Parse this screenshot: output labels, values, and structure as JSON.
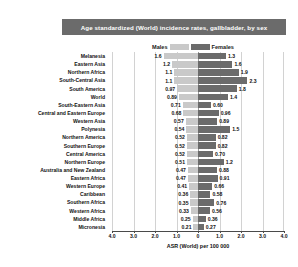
{
  "title": "Age standardized (World) incidence rates, gallbladder, by sex",
  "legend": {
    "males_label": "Males",
    "females_label": "Females",
    "males_color": "#c9c9c9",
    "females_color": "#6b6b6b"
  },
  "colors": {
    "banner": "#6b6b6b",
    "banner_text": "#ffffff",
    "male_bar": "#c9c9c9",
    "female_bar": "#6b6b6b",
    "grid": "#d2d2d2",
    "axis": "#4a4a4a"
  },
  "chart_data": {
    "type": "bar",
    "orientation": "horizontal-diverging",
    "title": "Age standardized (World) incidence rates, gallbladder, by sex",
    "xlabel": "ASR (World) per 100 000",
    "ylabel": "",
    "xlim": [
      -4.0,
      4.0
    ],
    "xticks": [
      "4.0",
      "3.0",
      "2.0",
      "1.0",
      "0",
      "1.0",
      "2.0",
      "3.0",
      "4.0"
    ],
    "xtick_values": [
      -4.0,
      -3.0,
      -2.0,
      -1.0,
      0,
      1.0,
      2.0,
      3.0,
      4.0
    ],
    "grid": true,
    "legend_position": "top-right",
    "categories": [
      "Melanesia",
      "Eastern Asia",
      "Northern Africa",
      "South-Central Asia",
      "South America",
      "World",
      "South-Eastern Asia",
      "Central and Eastern Europe",
      "Western Asia",
      "Polynesia",
      "Northern America",
      "Southern Europe",
      "Central America",
      "Northern Europe",
      "Australia and New Zealand",
      "Eastern Africa",
      "Western Europe",
      "Caribbean",
      "Southern Africa",
      "Western Africa",
      "Middle Africa",
      "Micronesia"
    ],
    "series": [
      {
        "name": "Males",
        "color": "#c9c9c9",
        "values": [
          1.6,
          1.2,
          1.1,
          1.1,
          0.97,
          0.89,
          0.71,
          0.68,
          0.57,
          0.54,
          0.52,
          0.52,
          0.52,
          0.51,
          0.47,
          0.47,
          0.41,
          0.36,
          0.35,
          0.33,
          0.25,
          0.21
        ],
        "labels": [
          "1.6",
          "1.2",
          "1.1",
          "1.1",
          "0.97",
          "0.89",
          "0.71",
          "0.68",
          "0.57",
          "0.54",
          "0.52",
          "0.52",
          "0.52",
          "0.51",
          "0.47",
          "0.47",
          "0.41",
          "0.36",
          "0.35",
          "0.33",
          "0.25",
          "0.21"
        ]
      },
      {
        "name": "Females",
        "color": "#6b6b6b",
        "values": [
          1.3,
          1.6,
          1.9,
          2.3,
          1.8,
          1.4,
          0.6,
          0.96,
          0.89,
          1.5,
          0.82,
          0.82,
          0.7,
          1.2,
          0.88,
          0.91,
          0.66,
          0.58,
          0.76,
          0.56,
          0.36,
          0.27
        ],
        "labels": [
          "1.3",
          "1.6",
          "1.9",
          "2.3",
          "1.8",
          "1.4",
          "0.60",
          "0.96",
          "0.89",
          "1.5",
          "0.82",
          "0.82",
          "0.70",
          "1.2",
          "0.88",
          "0.91",
          "0.66",
          "0.58",
          "0.76",
          "0.56",
          "0.36",
          "0.27"
        ]
      }
    ],
    "extra_value_label": "0.49"
  }
}
